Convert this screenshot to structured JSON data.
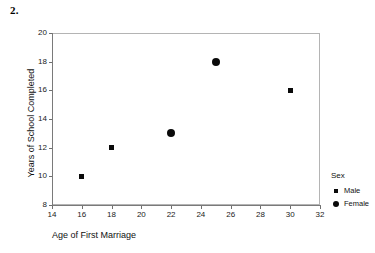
{
  "figure_number": "2.",
  "legend": {
    "title": "Sex",
    "entries": [
      {
        "label": "Male",
        "marker": "square-marker-icon"
      },
      {
        "label": "Female",
        "marker": "circle-marker-icon"
      }
    ]
  },
  "chart_data": {
    "type": "scatter",
    "title": "",
    "xlabel": "Age of First Marriage",
    "ylabel": "Years of School Completed",
    "xlim": [
      14,
      32
    ],
    "ylim": [
      8,
      20
    ],
    "xticks": [
      14,
      16,
      18,
      20,
      22,
      24,
      26,
      28,
      30,
      32
    ],
    "yticks": [
      8,
      10,
      12,
      14,
      16,
      18,
      20
    ],
    "xticklabels": [
      "14",
      "16",
      "18",
      "20",
      "22",
      "24",
      "26",
      "28",
      "30",
      "32"
    ],
    "yticklabels": [
      "8",
      "10",
      "12",
      "14",
      "16",
      "18",
      "20"
    ],
    "grid": false,
    "legend_position": "right",
    "series": [
      {
        "name": "Male",
        "marker": "square",
        "color": "#0a0a0a",
        "points": [
          {
            "x": 16,
            "y": 10
          },
          {
            "x": 18,
            "y": 12
          },
          {
            "x": 30,
            "y": 16
          }
        ]
      },
      {
        "name": "Female",
        "marker": "circle",
        "color": "#0a0a0a",
        "points": [
          {
            "x": 22,
            "y": 13
          },
          {
            "x": 25,
            "y": 18
          }
        ]
      }
    ]
  }
}
